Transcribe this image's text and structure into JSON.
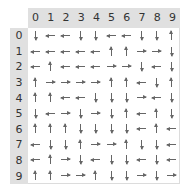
{
  "columns": [
    "0",
    "1",
    "2",
    "3",
    "4",
    "5",
    "6",
    "7",
    "8",
    "9"
  ],
  "rows": [
    "0",
    "1",
    "2",
    "3",
    "4",
    "5",
    "6",
    "7",
    "8",
    "9"
  ],
  "arrow_color": "#666666",
  "grid": [
    [
      "down",
      "left",
      "left",
      "down",
      "down",
      "left",
      "left",
      "down",
      "down",
      "up"
    ],
    [
      "left",
      "left",
      "left",
      "left",
      "left",
      "up",
      "up",
      "right",
      "right",
      "down"
    ],
    [
      "left",
      "up",
      "left",
      "left",
      "left",
      "right",
      "right",
      "down",
      "left",
      "down"
    ],
    [
      "up",
      "right",
      "right",
      "right",
      "right",
      "up",
      "up",
      "left",
      "down",
      "up"
    ],
    [
      "up",
      "up",
      "left",
      "left",
      "down",
      "down",
      "down",
      "right",
      "left",
      "down"
    ],
    [
      "down",
      "left",
      "right",
      "down",
      "right",
      "down",
      "up",
      "left",
      "up",
      "down"
    ],
    [
      "up",
      "up",
      "up",
      "down",
      "down",
      "down",
      "down",
      "left",
      "up",
      "left"
    ],
    [
      "left",
      "down",
      "down",
      "up",
      "right",
      "right",
      "up",
      "down",
      "down",
      "left"
    ],
    [
      "left",
      "up",
      "right",
      "down",
      "left",
      "down",
      "down",
      "left",
      "down",
      "left"
    ],
    [
      "up",
      "up",
      "right",
      "right",
      "up",
      "down",
      "down",
      "right",
      "down",
      "right"
    ]
  ]
}
